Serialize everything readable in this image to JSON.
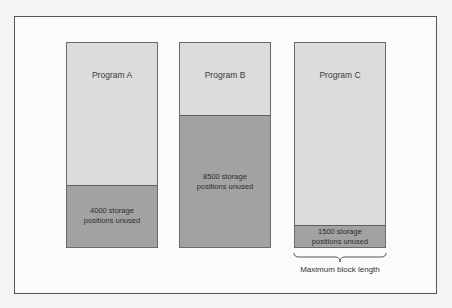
{
  "diagram": {
    "programs": [
      {
        "name": "Program A",
        "unused_label": "4000 storage\npositions unused",
        "unused_positions": 4000
      },
      {
        "name": "Program B",
        "unused_label": "8500 storage\npositions unused",
        "unused_positions": 8500
      },
      {
        "name": "Program C",
        "unused_label": "1500 storage\npositions unused",
        "unused_positions": 1500
      }
    ],
    "brace_label": "Maximum block length"
  },
  "colors": {
    "used": "#dcdcdc",
    "unused": "#a2a2a2",
    "frame": "#555555"
  }
}
